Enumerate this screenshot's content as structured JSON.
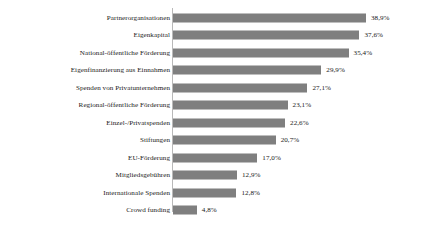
{
  "chart_data": {
    "type": "bar",
    "orientation": "horizontal",
    "title": "",
    "subtitle": "",
    "xlabel": "",
    "ylabel": "",
    "grid": false,
    "legend": null,
    "xlim": [
      0,
      38.9
    ],
    "value_suffix": "%",
    "decimal_separator": ",",
    "bar_color": "#7f7f7f",
    "axis_color": "#b9b9b9",
    "text_color": "#1a1a1a",
    "background": "#ffffff",
    "categories": [
      "Partnerorganisationen",
      "Eigenkapital",
      "National-öffentliche Förderung",
      "Eigenfinanzierung aus Einnahmen",
      "Spenden von Privatunternehmen",
      "Regional-öffentliche Förderung",
      "Einzel-/Privatspenden",
      "Stiftungen",
      "EU-Förderung",
      "Mitgliedsgebühren",
      "Internationale Spenden",
      "Crowd funding"
    ],
    "values": [
      38.9,
      37.6,
      35.4,
      29.9,
      27.1,
      23.1,
      22.6,
      20.7,
      17.0,
      12.9,
      12.8,
      4.8
    ],
    "value_labels": [
      "38,9%",
      "37,6%",
      "35,4%",
      "29,9%",
      "27,1%",
      "23,1%",
      "22,6%",
      "20,7%",
      "17,0%",
      "12,9%",
      "12,8%",
      "4,8%"
    ],
    "bars": [
      {
        "label": "Partnerorganisationen",
        "value": 38.9,
        "value_label": "38,9%"
      },
      {
        "label": "Eigenkapital",
        "value": 37.6,
        "value_label": "37,6%"
      },
      {
        "label": "National-öffentliche Förderung",
        "value": 35.4,
        "value_label": "35,4%"
      },
      {
        "label": "Eigenfinanzierung aus Einnahmen",
        "value": 29.9,
        "value_label": "29,9%"
      },
      {
        "label": "Spenden von Privatunternehmen",
        "value": 27.1,
        "value_label": "27,1%"
      },
      {
        "label": "Regional-öffentliche Förderung",
        "value": 23.1,
        "value_label": "23,1%"
      },
      {
        "label": "Einzel-/Privatspenden",
        "value": 22.6,
        "value_label": "22,6%"
      },
      {
        "label": "Stiftungen",
        "value": 20.7,
        "value_label": "20,7%"
      },
      {
        "label": "EU-Förderung",
        "value": 17.0,
        "value_label": "17,0%"
      },
      {
        "label": "Mitgliedsgebühren",
        "value": 12.9,
        "value_label": "12,9%"
      },
      {
        "label": "Internationale Spenden",
        "value": 12.8,
        "value_label": "12,8%"
      },
      {
        "label": "Crowd funding",
        "value": 4.8,
        "value_label": "4,8%"
      }
    ]
  },
  "layout": {
    "plot_left_px": 173,
    "plot_top_px": 9,
    "row_pitch_px": 17.5,
    "bar_height_px": 9,
    "px_per_percent": 4.96
  }
}
